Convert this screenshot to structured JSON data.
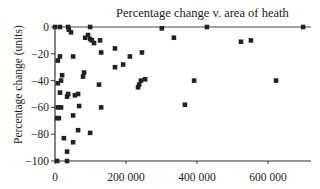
{
  "chart_data": {
    "type": "scatter",
    "title": "Percentage change v. area of heath",
    "xlabel": "",
    "ylabel": "Percentage change (units)",
    "xlim": [
      0,
      710000
    ],
    "ylim": [
      -100,
      0
    ],
    "xticks": [
      0,
      200000,
      400000,
      600000
    ],
    "xtick_labels": [
      "0",
      "200 000",
      "400 000",
      "600 000"
    ],
    "yticks": [
      0,
      -20,
      -40,
      -60,
      -80,
      -100
    ],
    "ytick_labels": [
      "0",
      "−20",
      "−40",
      "−60",
      "−80",
      "−100"
    ],
    "grid": false,
    "legend": null,
    "marker": "square",
    "marker_color": "#222222",
    "points": [
      {
        "x": 0,
        "y": 0
      },
      {
        "x": 14000,
        "y": 0
      },
      {
        "x": 37000,
        "y": 0
      },
      {
        "x": 99000,
        "y": 0
      },
      {
        "x": 39000,
        "y": -2
      },
      {
        "x": 45000,
        "y": -4
      },
      {
        "x": 85000,
        "y": -8
      },
      {
        "x": 93000,
        "y": -6
      },
      {
        "x": 99000,
        "y": -9
      },
      {
        "x": 104000,
        "y": -10
      },
      {
        "x": 110000,
        "y": -12
      },
      {
        "x": 127000,
        "y": -10
      },
      {
        "x": 130000,
        "y": -19
      },
      {
        "x": 8000,
        "y": -25
      },
      {
        "x": 14000,
        "y": -22
      },
      {
        "x": 51000,
        "y": -22
      },
      {
        "x": 169000,
        "y": -16
      },
      {
        "x": 169000,
        "y": -30
      },
      {
        "x": 192000,
        "y": -28
      },
      {
        "x": 211000,
        "y": -22
      },
      {
        "x": 245000,
        "y": -19
      },
      {
        "x": 82000,
        "y": -34
      },
      {
        "x": 79000,
        "y": -37
      },
      {
        "x": 20000,
        "y": -36
      },
      {
        "x": 17000,
        "y": -40
      },
      {
        "x": 8000,
        "y": -42
      },
      {
        "x": 242000,
        "y": -40
      },
      {
        "x": 237000,
        "y": -43
      },
      {
        "x": 254000,
        "y": -39
      },
      {
        "x": 234000,
        "y": -45
      },
      {
        "x": 124000,
        "y": -43
      },
      {
        "x": 14000,
        "y": -49
      },
      {
        "x": 37000,
        "y": -50
      },
      {
        "x": 34000,
        "y": -52
      },
      {
        "x": 56000,
        "y": -51
      },
      {
        "x": 65000,
        "y": -50
      },
      {
        "x": 8000,
        "y": -60
      },
      {
        "x": 17000,
        "y": -60
      },
      {
        "x": 68000,
        "y": -59
      },
      {
        "x": 130000,
        "y": -60
      },
      {
        "x": 6000,
        "y": -68
      },
      {
        "x": 11000,
        "y": -68
      },
      {
        "x": 51000,
        "y": -66
      },
      {
        "x": 65000,
        "y": -77
      },
      {
        "x": 99000,
        "y": -79
      },
      {
        "x": 25000,
        "y": -83
      },
      {
        "x": 51000,
        "y": -86
      },
      {
        "x": 34000,
        "y": -93
      },
      {
        "x": 34000,
        "y": -100
      },
      {
        "x": 6000,
        "y": -100
      },
      {
        "x": 301000,
        "y": -1
      },
      {
        "x": 428000,
        "y": 0
      },
      {
        "x": 335000,
        "y": -8
      },
      {
        "x": 524000,
        "y": -11
      },
      {
        "x": 552000,
        "y": -10
      },
      {
        "x": 699000,
        "y": 0
      },
      {
        "x": 392000,
        "y": -40
      },
      {
        "x": 623000,
        "y": -40
      },
      {
        "x": 366000,
        "y": -58
      }
    ]
  },
  "labels": {
    "title": "Percentage change v. area of heath",
    "ylabel": "Percentage change (units)"
  }
}
